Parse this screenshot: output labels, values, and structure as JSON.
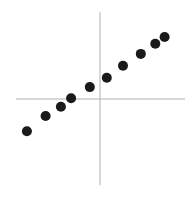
{
  "chart_data": {
    "type": "scatter",
    "title": "",
    "xlabel": "",
    "ylabel": "",
    "xlim": [
      -1,
      1
    ],
    "ylim": [
      -1,
      1
    ],
    "grid": false,
    "legend": null,
    "axes_style": "centered cross-hair axes, no ticks or labels",
    "series": [
      {
        "name": "points",
        "color": "#1a1a1a",
        "x": [
          -0.86,
          -0.64,
          -0.46,
          -0.34,
          -0.12,
          0.08,
          0.27,
          0.48,
          0.65,
          0.76
        ],
        "y": [
          -0.38,
          -0.2,
          -0.09,
          0.01,
          0.14,
          0.25,
          0.39,
          0.53,
          0.65,
          0.73
        ]
      }
    ]
  },
  "layout": {
    "origin_px": [
      100,
      99
    ],
    "unit_px": 85,
    "h_axis": {
      "x1": 16,
      "x2": 185,
      "y": 99
    },
    "v_axis": {
      "x": 100,
      "y1": 12,
      "y2": 185
    },
    "axis_color": "#b0b0b0",
    "point_radius": 5
  }
}
